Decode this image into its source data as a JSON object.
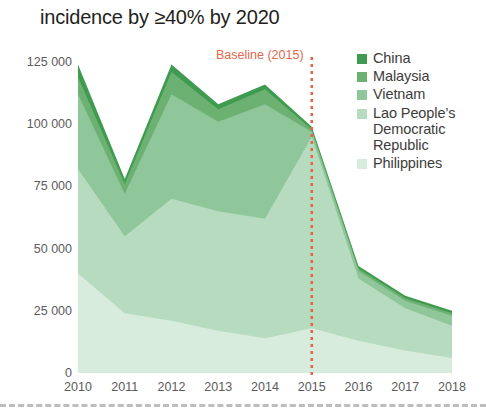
{
  "header": {
    "title": "incidence by ≥40% by 2020"
  },
  "annotation": {
    "baseline_label": "Baseline (2015)",
    "baseline_year": 2015,
    "baseline_color": "#e2674a"
  },
  "legend": {
    "position": "right",
    "items": [
      {
        "label": "China",
        "color": "#3f9b4f"
      },
      {
        "label": "Malaysia",
        "color": "#6cb172"
      },
      {
        "label": "Vietnam",
        "color": "#8fc79a"
      },
      {
        "label": "Lao People’s\nDemocratic\nRepublic",
        "color": "#b6dbbe"
      },
      {
        "label": "Philippines",
        "color": "#d8ecdd"
      }
    ]
  },
  "chart_data": {
    "type": "area",
    "stacked": true,
    "title": "incidence by ≥40% by 2020",
    "xlabel": "",
    "ylabel": "",
    "x": [
      2010,
      2011,
      2012,
      2013,
      2014,
      2015,
      2016,
      2017,
      2018
    ],
    "xtick_labels": [
      "2010",
      "2011",
      "2012",
      "2013",
      "2014",
      "2015",
      "2016",
      "2017",
      "2018"
    ],
    "ytick_labels": [
      "0",
      "25 000",
      "50 000",
      "75 000",
      "100 000",
      "125 000"
    ],
    "ytick_values": [
      0,
      25000,
      50000,
      75000,
      100000,
      125000
    ],
    "ylim": [
      0,
      125000
    ],
    "xlim": [
      2010,
      2018
    ],
    "grid": false,
    "series": [
      {
        "name": "Philippines",
        "color": "#d8ecdd",
        "values": [
          40000,
          24000,
          21000,
          17000,
          14000,
          18000,
          13000,
          9000,
          6000
        ]
      },
      {
        "name": "Lao People’s Democratic Republic",
        "color": "#b6dbbe",
        "values": [
          42000,
          31000,
          49000,
          48000,
          48000,
          77000,
          25000,
          17000,
          13000
        ]
      },
      {
        "name": "Vietnam",
        "color": "#8fc79a",
        "values": [
          30000,
          17000,
          42000,
          36000,
          46000,
          2000,
          3000,
          3000,
          4000
        ]
      },
      {
        "name": "Malaysia",
        "color": "#6cb172",
        "values": [
          7000,
          4000,
          9000,
          5000,
          6000,
          1000,
          1000,
          1000,
          1000
        ]
      },
      {
        "name": "China",
        "color": "#3f9b4f",
        "values": [
          5000,
          2000,
          3000,
          2000,
          2000,
          1000,
          1000,
          1000,
          1000
        ]
      }
    ],
    "totals": [
      124000,
      78000,
      124000,
      108000,
      116000,
      99000,
      43000,
      31000,
      25000
    ],
    "annotations": [
      {
        "text": "Baseline (2015)",
        "x": 2015,
        "color": "#e2674a",
        "style": "vertical dotted line"
      }
    ]
  },
  "geometry": {
    "plot_left": 78,
    "plot_right": 452,
    "plot_top": 62,
    "plot_bottom": 373
  }
}
